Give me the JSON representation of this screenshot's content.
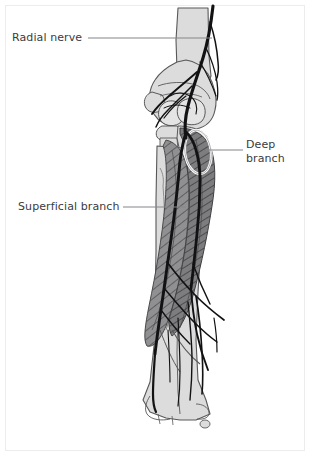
{
  "figure": {
    "kind": "anatomical-illustration",
    "view": "anterior view of right elbow and forearm",
    "background_color": "#ffffff",
    "frame_color": "#ececed"
  },
  "palette": {
    "bone_fill": "#dcdcdc",
    "bone_fill_light": "#e4e4e4",
    "bone_outline": "#58585a",
    "muscle_fill": "#909092",
    "muscle_fill_dark": "#7d7d80",
    "muscle_hatch": "#4a4a4c",
    "nerve_color": "#121214",
    "arcade_outline": "#ffffff",
    "label_text": "#3b3b3d",
    "leader_line": "#85858a"
  },
  "labels": {
    "radial_nerve": {
      "text": "Radial nerve",
      "lines": [
        "Radial nerve"
      ],
      "align": "left",
      "x": 12,
      "y": 31,
      "leader": {
        "x1": 88,
        "y1": 38,
        "x2": 212,
        "y2": 38
      }
    },
    "deep_branch": {
      "text": "Deep branch",
      "lines": [
        "Deep",
        "branch"
      ],
      "align": "left",
      "x": 246,
      "y": 138,
      "leader": {
        "x1": 228,
        "y1": 150,
        "x2": 206,
        "y2": 150
      }
    },
    "superficial_branch": {
      "text": "Superficial branch",
      "lines": [
        "Superficial branch"
      ],
      "align": "left",
      "x": 18,
      "y": 200,
      "leader": {
        "x1": 123,
        "y1": 207,
        "x2": 186,
        "y2": 207
      }
    }
  },
  "structures": [
    {
      "name": "humerus-shaft",
      "type": "bone"
    },
    {
      "name": "lateral-epicondyle",
      "type": "bone"
    },
    {
      "name": "medial-epicondyle",
      "type": "bone"
    },
    {
      "name": "capitellum",
      "type": "bone"
    },
    {
      "name": "radial-head",
      "type": "bone"
    },
    {
      "name": "radius-shaft",
      "type": "bone"
    },
    {
      "name": "ulna-shaft",
      "type": "bone"
    },
    {
      "name": "distal-radius-styloid",
      "type": "bone"
    },
    {
      "name": "extensor-muscle-group",
      "type": "muscle"
    },
    {
      "name": "supinator-muscle",
      "type": "muscle"
    },
    {
      "name": "arcade-of-frohse",
      "type": "fibrous-arcade"
    },
    {
      "name": "radial-nerve-trunk",
      "type": "nerve"
    },
    {
      "name": "deep-branch-nerve",
      "type": "nerve"
    },
    {
      "name": "superficial-branch-nerve",
      "type": "nerve"
    },
    {
      "name": "muscular-branches",
      "type": "nerve"
    }
  ]
}
